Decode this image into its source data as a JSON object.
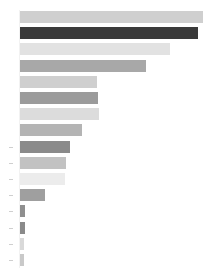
{
  "chart_data": {
    "type": "bar",
    "orientation": "horizontal",
    "title": "",
    "subtitle": "",
    "xlabel": "",
    "ylabel": "",
    "grid": false,
    "legend": null,
    "legend_position": "none",
    "xlim": [
      0,
      100
    ],
    "categories": [
      "Category 1",
      "Category 2",
      "Category 3",
      "Category 4",
      "Category 5",
      "Category 6",
      "Category 7",
      "Category 8",
      "Category 9",
      "Category 10",
      "Category 11",
      "Category 12",
      "Category 13",
      "Category 14",
      "Category 15",
      "Category 16"
    ],
    "tick_labels": [],
    "values": [
      100,
      97,
      82,
      68,
      41,
      42,
      43,
      33,
      27,
      25,
      24,
      13,
      3,
      3,
      2,
      2
    ],
    "bar_colors": [
      "#cfcfcf",
      "#3a3a3a",
      "#e2e2e2",
      "#a8a8a8",
      "#cfcfcf",
      "#9b9b9b",
      "#dcdcdc",
      "#b4b4b4",
      "#8a8a8a",
      "#c2c2c2",
      "#ececec",
      "#9f9f9f",
      "#8f8f8f",
      "#8a8a8a",
      "#d9d9d9",
      "#c9c9c9"
    ],
    "bar_pixel_lengths": [
      183,
      178,
      150,
      126,
      77,
      78,
      79,
      62,
      50,
      46,
      45,
      25,
      5,
      5,
      4,
      4
    ],
    "tick_count": 8
  }
}
